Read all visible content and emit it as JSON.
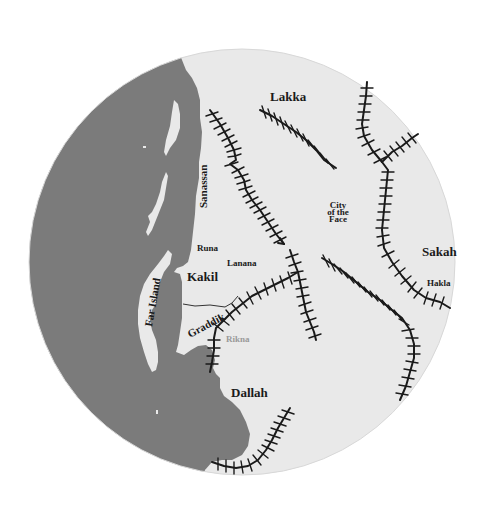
{
  "map": {
    "colors": {
      "sea": "#7b7b7b",
      "land": "#e9e9e9",
      "background": "#ffffff",
      "mountains": "#1a1a1a"
    },
    "labels": {
      "lakka": "Lakka",
      "sanassan": "Sanassan",
      "city_line1": "City",
      "city_line2": "of the",
      "city_line3": "Face",
      "sakah": "Sakah",
      "hakla": "Hakla",
      "runa": "Runa",
      "lanana": "Lanana",
      "kakil": "Kakil",
      "far_island": "Far Island",
      "graddik": "Graddik",
      "rikna": "Rikna",
      "dallah": "Dallah"
    }
  }
}
